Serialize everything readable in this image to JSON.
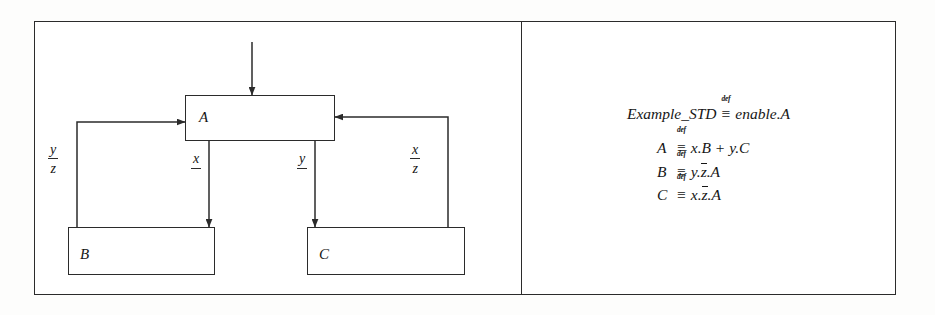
{
  "figure": {
    "caption_text": "",
    "panels": {
      "left": "block-diagram",
      "right": "process-definitions"
    },
    "colors": {
      "ink": "#2b2b2b",
      "text": "#161616",
      "paper": "#ffffff"
    }
  },
  "diagram": {
    "nodes": [
      {
        "id": "A",
        "label": "A"
      },
      {
        "id": "B",
        "label": "B"
      },
      {
        "id": "C",
        "label": "C"
      }
    ],
    "signals": [
      {
        "id": "yz",
        "numerator": "y",
        "denominator": "z"
      },
      {
        "id": "x",
        "numerator": "x",
        "denominator": ""
      },
      {
        "id": "y",
        "numerator": "y",
        "denominator": ""
      },
      {
        "id": "xz",
        "numerator": "x",
        "denominator": "z"
      }
    ]
  },
  "equations": {
    "header": {
      "lhs": "Example_STD",
      "op_tag": "def",
      "op_symbol": "≡",
      "rhs": "enable.A"
    },
    "rows": [
      {
        "lhs": "A",
        "op_tag": "def",
        "op_symbol": "≡",
        "rhs_plain": "x.B  +  y.C",
        "rhs_parts": [
          {
            "text": "x.B  +  y.C",
            "overbar": false
          }
        ]
      },
      {
        "lhs": "B",
        "op_tag": "def",
        "op_symbol": "≡",
        "rhs_plain": "y.z̄.A",
        "rhs_parts": [
          {
            "text": "y.",
            "overbar": false
          },
          {
            "text": "z",
            "overbar": true
          },
          {
            "text": ".A",
            "overbar": false
          }
        ]
      },
      {
        "lhs": "C",
        "op_tag": "def",
        "op_symbol": "≡",
        "rhs_plain": "x.z̄.A",
        "rhs_parts": [
          {
            "text": "x.",
            "overbar": false
          },
          {
            "text": "z",
            "overbar": true
          },
          {
            "text": ".A",
            "overbar": false
          }
        ]
      }
    ]
  }
}
